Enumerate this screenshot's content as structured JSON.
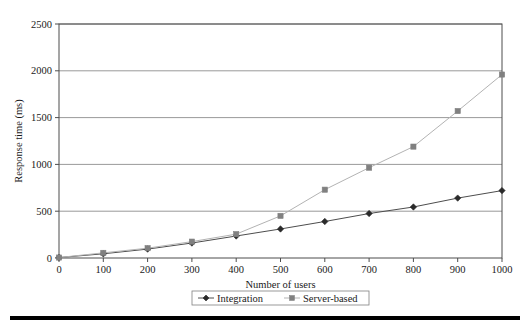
{
  "figure": {
    "cut_caption": "",
    "bottom_rule_color": "#000000",
    "background": "#ffffff"
  },
  "chart_data": {
    "type": "line",
    "title": "",
    "xlabel": "Number of users",
    "ylabel": "Response time (ms)",
    "x": [
      0,
      100,
      200,
      300,
      400,
      500,
      600,
      700,
      800,
      900,
      1000
    ],
    "xlim": [
      0,
      1000
    ],
    "ylim": [
      0,
      2500
    ],
    "xticks": [
      "0",
      "100",
      "200",
      "300",
      "400",
      "500",
      "600",
      "700",
      "800",
      "900",
      "1000"
    ],
    "yticks": [
      "0",
      "500",
      "1000",
      "1500",
      "2000",
      "2500"
    ],
    "ytick_values": [
      0,
      500,
      1000,
      1500,
      2000,
      2500
    ],
    "grid": "horizontal",
    "legend_position": "bottom-center",
    "series": [
      {
        "name": "Integration",
        "marker": "diamond",
        "color": "#2a2a2a",
        "line_color": "#4d4d4d",
        "values": [
          5,
          45,
          95,
          160,
          235,
          310,
          390,
          475,
          545,
          640,
          720
        ]
      },
      {
        "name": "Server-based",
        "marker": "square",
        "color": "#808080",
        "line_color": "#b3b3b3",
        "values": [
          5,
          55,
          105,
          175,
          255,
          450,
          730,
          965,
          1190,
          1570,
          1960
        ]
      }
    ]
  },
  "axes": {
    "plot_border_color": "#4d4d4d",
    "gridline_color": "#7f7f7f"
  }
}
